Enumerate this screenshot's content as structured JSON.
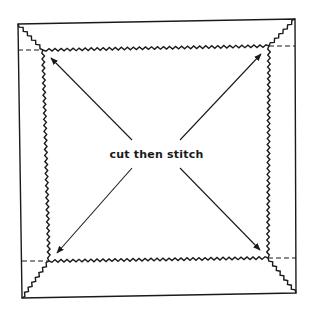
{
  "diagram": {
    "label": "cut then stitch",
    "colors": {
      "ink": "#1a1a1a",
      "paper": "#ffffff"
    },
    "outer_square": {
      "tl": [
        18,
        24
      ],
      "tr": [
        295,
        19
      ],
      "br": [
        296,
        293
      ],
      "bl": [
        22,
        298
      ]
    },
    "inner_square": {
      "tl": [
        43,
        50
      ],
      "tr": [
        269,
        46
      ],
      "br": [
        268,
        258
      ],
      "bl": [
        49,
        261
      ]
    },
    "arrows": [
      {
        "from": "center",
        "to": "inner.tl"
      },
      {
        "from": "center",
        "to": "inner.tr"
      },
      {
        "from": "center",
        "to": "inner.bl"
      },
      {
        "from": "center",
        "to": "inner.br"
      }
    ],
    "fold_lines": "dashed extensions of inner square edges to outer square",
    "stitch_lines": "zigzag (pinked) along inner square and diagonal mitres"
  }
}
